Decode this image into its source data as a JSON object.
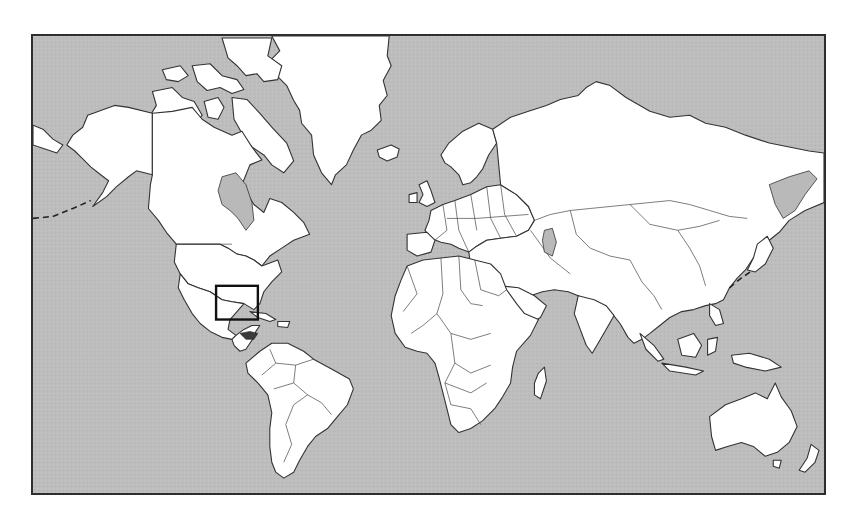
{
  "map": {
    "type": "world-locator-map",
    "projection": "mercator",
    "colors": {
      "ocean": "#bcbcbc",
      "land": "#ffffff",
      "outline": "#333333",
      "highlight_box": "#111111",
      "highlight_country": "#3a3a3a"
    },
    "highlight": {
      "region": "Central America",
      "country": "Honduras",
      "box": {
        "x": 215,
        "y": 286,
        "width": 42,
        "height": 34
      }
    },
    "features": [
      "international-date-line-dashed"
    ]
  }
}
